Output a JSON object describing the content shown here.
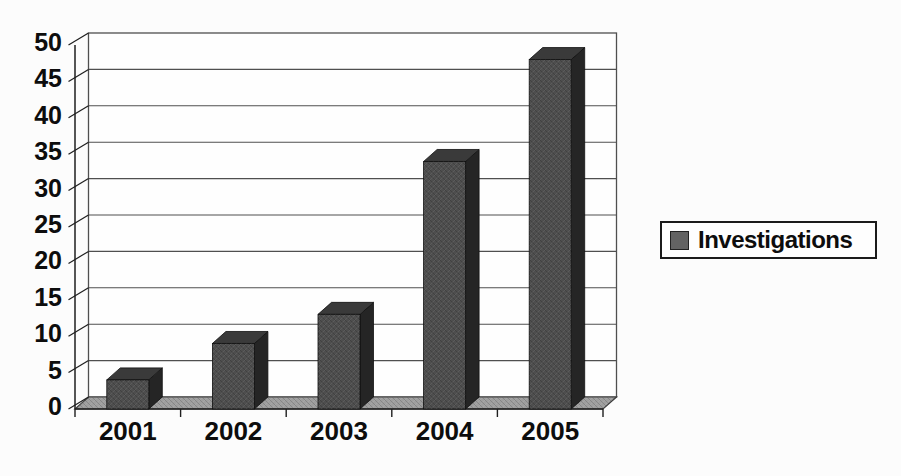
{
  "chart_data": {
    "type": "bar",
    "variant": "3d-column",
    "title": "",
    "xlabel": "",
    "ylabel": "",
    "categories": [
      "2001",
      "2002",
      "2003",
      "2004",
      "2005"
    ],
    "series": [
      {
        "name": "Investigations",
        "values": [
          4,
          9,
          13,
          34,
          48
        ]
      }
    ],
    "ylim": [
      0,
      50
    ],
    "ytick_step": 5,
    "yticks": [
      0,
      5,
      10,
      15,
      20,
      25,
      30,
      35,
      40,
      45,
      50
    ],
    "grid": true,
    "legend": {
      "position": "middle-right",
      "entries": [
        {
          "label": "Investigations",
          "swatch_color": "#636363"
        }
      ]
    },
    "colors": {
      "bar_front": "#4e4e4e",
      "bar_top": "#3a3a3a",
      "bar_side": "#252525",
      "floor": "#9e9e9e",
      "wall_background": "#fefefe",
      "gridline": "#4f4f4f",
      "axis_line": "#1f1f1f",
      "axis_text": "#0d0d0d",
      "page_background": "#fcfcfc"
    }
  }
}
